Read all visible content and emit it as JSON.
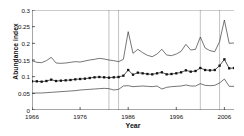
{
  "chart_data": {
    "type": "line",
    "title": "",
    "xlabel": "Year",
    "ylabel": "Abundance index",
    "xlim": [
      1966,
      2008
    ],
    "ylim": [
      0,
      0.3
    ],
    "grid": "vertical-only",
    "legend": "none",
    "xticks": [
      1966,
      1976,
      1986,
      1996,
      2006
    ],
    "yticks": [
      "0",
      "0.05",
      "0.1",
      "0.15",
      "0.2",
      "0.25",
      "0.3"
    ],
    "ytick_values": [
      0,
      0.05,
      0.1,
      0.15,
      0.2,
      0.25,
      0.3
    ],
    "annotations": {
      "vertical_reference_lines": [
        1982,
        1984,
        2001,
        2005
      ]
    },
    "x": [
      1966,
      1967,
      1968,
      1969,
      1970,
      1971,
      1972,
      1973,
      1974,
      1975,
      1976,
      1977,
      1978,
      1979,
      1980,
      1981,
      1982,
      1983,
      1984,
      1985,
      1986,
      1987,
      1988,
      1989,
      1990,
      1991,
      1992,
      1993,
      1994,
      1995,
      1996,
      1997,
      1998,
      1999,
      2000,
      2001,
      2002,
      2003,
      2004,
      2005,
      2006,
      2007,
      2008
    ],
    "series": [
      {
        "name": "Upper confidence limit",
        "style": "thin-line",
        "values": [
          0.148,
          0.143,
          0.142,
          0.148,
          0.158,
          0.141,
          0.14,
          0.141,
          0.143,
          0.145,
          0.144,
          0.147,
          0.15,
          0.152,
          0.155,
          0.153,
          0.15,
          0.148,
          0.145,
          0.152,
          0.235,
          0.17,
          0.182,
          0.172,
          0.164,
          0.16,
          0.168,
          0.182,
          0.165,
          0.163,
          0.168,
          0.176,
          0.197,
          0.18,
          0.182,
          0.219,
          0.186,
          0.178,
          0.175,
          0.205,
          0.27,
          0.2,
          0.201
        ]
      },
      {
        "name": "Abundance index",
        "style": "line-with-square-markers",
        "values": [
          0.086,
          0.086,
          0.085,
          0.087,
          0.091,
          0.087,
          0.088,
          0.089,
          0.09,
          0.092,
          0.093,
          0.094,
          0.096,
          0.098,
          0.099,
          0.098,
          0.097,
          0.098,
          0.099,
          0.103,
          0.12,
          0.106,
          0.112,
          0.11,
          0.108,
          0.107,
          0.11,
          0.113,
          0.107,
          0.108,
          0.11,
          0.113,
          0.119,
          0.115,
          0.117,
          0.126,
          0.12,
          0.119,
          0.12,
          0.133,
          0.152,
          0.125,
          0.126
        ]
      },
      {
        "name": "Lower confidence limit",
        "style": "thin-line",
        "values": [
          0.05,
          0.051,
          0.051,
          0.052,
          0.053,
          0.054,
          0.055,
          0.056,
          0.057,
          0.058,
          0.06,
          0.061,
          0.062,
          0.063,
          0.064,
          0.065,
          0.064,
          0.06,
          0.062,
          0.072,
          0.073,
          0.07,
          0.071,
          0.072,
          0.071,
          0.07,
          0.072,
          0.063,
          0.068,
          0.07,
          0.071,
          0.072,
          0.075,
          0.072,
          0.072,
          0.079,
          0.074,
          0.073,
          0.074,
          0.081,
          0.093,
          0.071,
          0.071
        ]
      }
    ]
  }
}
